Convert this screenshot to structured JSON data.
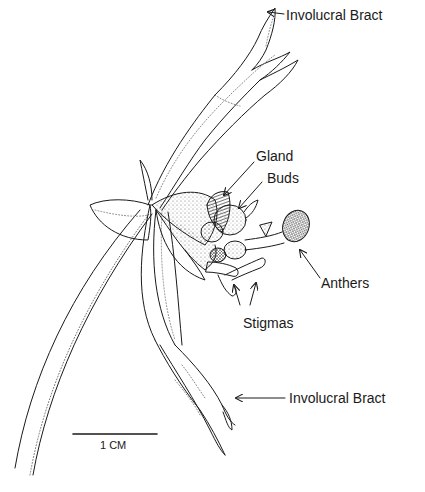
{
  "diagram": {
    "type": "botanical-illustration",
    "labels": [
      {
        "id": "involucral-bract-top",
        "text": "Involucral Bract",
        "x": 286,
        "y": 8
      },
      {
        "id": "gland",
        "text": "Gland",
        "x": 256,
        "y": 149
      },
      {
        "id": "buds",
        "text": "Buds",
        "x": 267,
        "y": 171
      },
      {
        "id": "anthers",
        "text": "Anthers",
        "x": 321,
        "y": 276
      },
      {
        "id": "stigmas",
        "text": "Stigmas",
        "x": 243,
        "y": 316
      },
      {
        "id": "involucral-bract-bottom",
        "text": "Involucral Bract",
        "x": 289,
        "y": 391
      }
    ],
    "scale_bar": {
      "label": "1 CM",
      "x1": 73,
      "x2": 157,
      "y": 434
    },
    "colors": {
      "ink": "#1a1a1a",
      "stipple": "#555555",
      "background": "#ffffff"
    }
  }
}
